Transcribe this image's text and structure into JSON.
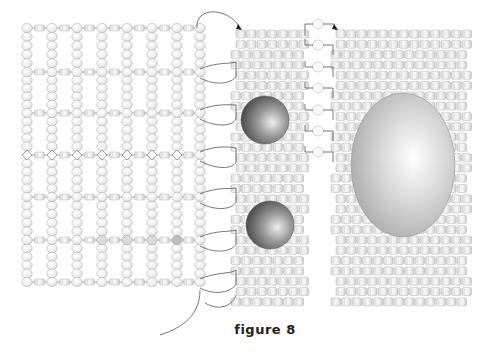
{
  "figure": {
    "caption": "figure 8",
    "colors": {
      "background": "#ffffff",
      "bead_fill": "#ececec",
      "bead_stroke": "#bdbdbd",
      "thread": "#555555",
      "sphere_dark": "#555555",
      "sphere_light": "#e6e6e6",
      "egg_fill": "#c4c4c4"
    },
    "left_netting": {
      "description": "right-angle weave / netting grid of round seed beads with cylinder beads on horizontal rows",
      "columns_x": [
        27,
        52,
        77,
        102,
        127,
        152,
        177,
        200
      ],
      "row_y": [
        28,
        72,
        113,
        155,
        197,
        240,
        282
      ],
      "vertical_bead_spacing": 10.5
    },
    "middle_panel": {
      "description": "peyote stitch panel of cylinder beads",
      "x": 236,
      "y": 30,
      "cols": 7,
      "rows": 27
    },
    "connector_beads": {
      "x": 318,
      "y": [
        24,
        45,
        67,
        88,
        110,
        131,
        152
      ]
    },
    "right_panel": {
      "description": "peyote stitch panel of cylinder beads",
      "x": 336,
      "y": 30,
      "cols": 13,
      "rows": 27
    },
    "shapes": [
      {
        "type": "sphere",
        "name": "upper-sphere",
        "cx": 265,
        "cy": 120,
        "r": 24
      },
      {
        "type": "sphere",
        "name": "lower-sphere",
        "cx": 270,
        "cy": 225,
        "r": 24
      },
      {
        "type": "egg",
        "name": "large-oval-stone",
        "cx": 403,
        "cy": 165,
        "rx": 52,
        "ry": 72
      }
    ]
  }
}
